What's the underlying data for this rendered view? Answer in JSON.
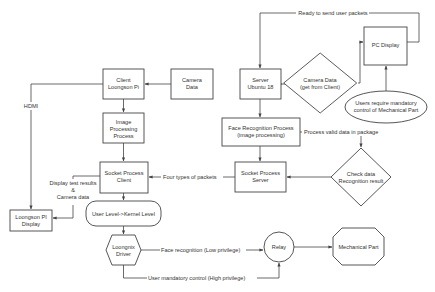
{
  "diagram": {
    "colors": {
      "stroke": "#444444",
      "text": "#333333",
      "background": "#ffffff"
    },
    "nodes": {
      "client_loongson": {
        "shape": "rectangle",
        "lines": [
          "Client",
          "Loongson Pi"
        ]
      },
      "camera_data": {
        "shape": "rectangle",
        "lines": [
          "Camera",
          "Data"
        ]
      },
      "image_processing": {
        "shape": "rectangle",
        "lines": [
          "Image",
          "Processing",
          "Process"
        ]
      },
      "socket_client": {
        "shape": "rectangle",
        "lines": [
          "Socket Process",
          "Client"
        ]
      },
      "user_kernel": {
        "shape": "rounded-rectangle",
        "lines": [
          "User Level->Kernel Level"
        ]
      },
      "loongnix_driver": {
        "shape": "hexagon",
        "lines": [
          "Loongnix",
          "Driver"
        ]
      },
      "loongson_display": {
        "shape": "rectangle",
        "lines": [
          "Loongson PI",
          "Display"
        ]
      },
      "server_ubuntu": {
        "shape": "rectangle",
        "lines": [
          "Server",
          "Ubuntu 18"
        ]
      },
      "camera_data_diamond": {
        "shape": "diamond",
        "lines": [
          "Camera Data",
          "(get from Client)"
        ]
      },
      "pc_display": {
        "shape": "rectangle",
        "lines": [
          "PC Display"
        ]
      },
      "users_require": {
        "shape": "ellipse",
        "lines": [
          "Users require mandatory",
          "control of Mechanical Part"
        ]
      },
      "face_recognition": {
        "shape": "rectangle",
        "lines": [
          "Face Recognition Process",
          "(image processing)"
        ]
      },
      "check_data": {
        "shape": "diamond",
        "lines": [
          "Check data",
          "Recognition result"
        ]
      },
      "socket_server": {
        "shape": "rectangle",
        "lines": [
          "Socket Process",
          "Server"
        ]
      },
      "relay": {
        "shape": "circle",
        "lines": [
          "Relay"
        ]
      },
      "mechanical_part": {
        "shape": "octagon",
        "lines": [
          "Mechanical Part"
        ]
      }
    },
    "edge_labels": {
      "hdmi": "HDMI",
      "ready_to_send": "Ready to send user packets",
      "process_valid": "Process valid data in package",
      "four_types": "Four types of packets",
      "display_results": [
        "Display test results",
        "&",
        "Camera data"
      ],
      "face_low": "Face recognition (Low privilege)",
      "user_high": "User mandatory control  (High privilege)"
    }
  }
}
